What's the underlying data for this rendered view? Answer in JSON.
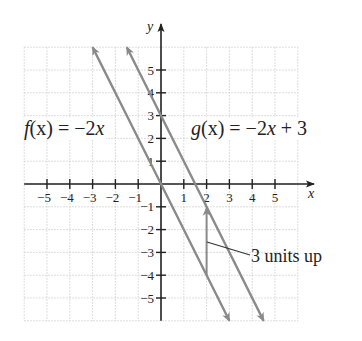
{
  "chart_data": {
    "type": "line",
    "title": "",
    "xlabel": "x",
    "ylabel": "y",
    "xlim": [
      -6,
      6
    ],
    "ylim": [
      -6,
      6
    ],
    "grid": true,
    "x_ticks": [
      -5,
      -4,
      -3,
      -2,
      -1,
      1,
      2,
      3,
      4,
      5
    ],
    "y_ticks": [
      -5,
      -4,
      -3,
      -2,
      -1,
      1,
      2,
      3,
      4,
      5
    ],
    "x_tick_labels": [
      "−5",
      "−4",
      "−3",
      "−2",
      "−1",
      "1",
      "2",
      "3",
      "4",
      "5"
    ],
    "y_tick_labels": [
      "−5",
      "−4",
      "−3",
      "−2",
      "−1",
      "1",
      "2",
      "3",
      "4",
      "5"
    ],
    "series": [
      {
        "name": "f(x) = −2x",
        "slope": -2,
        "intercept": 0,
        "x": [
          -3,
          3
        ],
        "y": [
          6,
          -6
        ],
        "color": "#8a8a8a"
      },
      {
        "name": "g(x) = −2x + 3",
        "slope": -2,
        "intercept": 3,
        "x": [
          -1.5,
          4.5
        ],
        "y": [
          6,
          -6
        ],
        "color": "#8a8a8a"
      }
    ],
    "annotations": [
      {
        "type": "arrow",
        "x": 2,
        "from_y": -4,
        "to_y": -1,
        "text": "3 units up"
      }
    ]
  },
  "labels": {
    "f_name": "f",
    "f_arg": "(x)",
    "f_rhs": " = −2",
    "f_var": "x",
    "g_name": "g",
    "g_arg": "(x)",
    "g_rhs": " = −2",
    "g_var": "x",
    "g_tail": " + 3",
    "annotation": "3 units up",
    "x_axis": "x",
    "y_axis": "y"
  },
  "colors": {
    "line": "#8a8a8a",
    "axis": "#222222",
    "grid": "#c8c8c8"
  }
}
